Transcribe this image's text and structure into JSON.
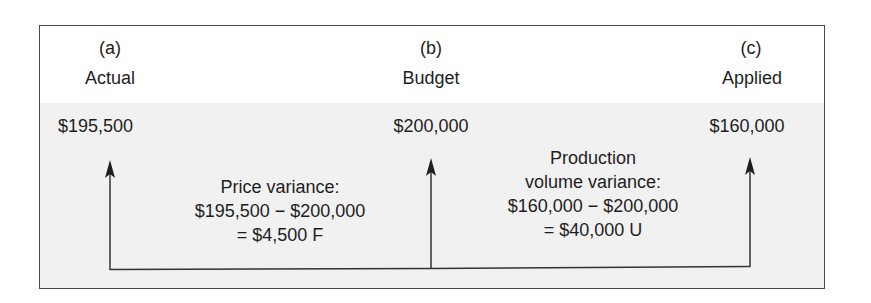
{
  "columns": [
    {
      "letter": "(a)",
      "label": "Actual",
      "amount": "$195,500"
    },
    {
      "letter": "(b)",
      "label": "Budget",
      "amount": "$200,000"
    },
    {
      "letter": "(c)",
      "label": "Applied",
      "amount": "$160,000"
    }
  ],
  "variances": [
    {
      "lines": [
        "Price variance:",
        "$195,500 − $200,000",
        "= $4,500 F"
      ]
    },
    {
      "lines": [
        "Production",
        "volume variance:",
        "$160,000 − $200,000",
        "= $40,000 U"
      ]
    }
  ],
  "colors": {
    "border": "#4a4a4a",
    "shade": "#f1f1f1",
    "text": "#1e1e1e",
    "arrow": "#1e1e1e"
  }
}
